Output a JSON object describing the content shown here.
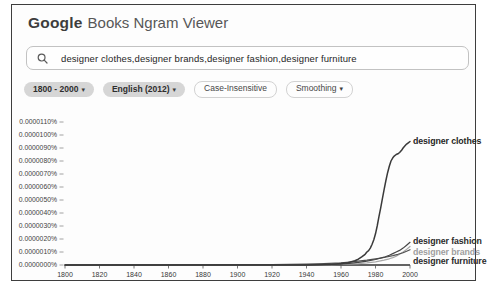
{
  "header": {
    "logo": "Google",
    "product": "Books Ngram Viewer"
  },
  "search": {
    "query": "designer clothes,designer brands,designer fashion,designer furniture"
  },
  "icons": {
    "search": "magnifier-icon",
    "dropdown_caret": "▾"
  },
  "filters": [
    {
      "label": "1800 - 2000",
      "dropdown": true,
      "filled": true
    },
    {
      "label": "English (2012)",
      "dropdown": true,
      "filled": true
    },
    {
      "label": "Case-Insensitive",
      "dropdown": false,
      "filled": false
    },
    {
      "label": "Smoothing",
      "dropdown": true,
      "filled": false
    }
  ],
  "chart_data": {
    "type": "line",
    "title": "",
    "xlabel": "",
    "ylabel": "",
    "x_range": [
      1800,
      2000
    ],
    "y_range_percent": [
      0,
      1.15e-05
    ],
    "y_unit": "percent, values below given in 1e-6 %",
    "grid": false,
    "legend_position": "end-of-line labels",
    "xticks": [
      1800,
      1820,
      1840,
      1860,
      1880,
      1900,
      1920,
      1940,
      1960,
      1980,
      2000
    ],
    "yticks": [
      "0.0000110%",
      "0.0000100%",
      "0.0000090%",
      "0.0000080%",
      "0.0000070%",
      "0.0000060%",
      "0.0000050%",
      "0.0000040%",
      "0.0000030%",
      "0.0000020%",
      "0.0000010%",
      "0.0000000%"
    ],
    "series": [
      {
        "name": "designer brands",
        "color": "#a8a8a8",
        "label_color": "#9f9f9f",
        "label_dy": 6,
        "points": [
          [
            1800,
            0
          ],
          [
            1900,
            0
          ],
          [
            1950,
            0.01
          ],
          [
            1960,
            0.04
          ],
          [
            1970,
            0.1
          ],
          [
            1975,
            0.16
          ],
          [
            1980,
            0.25
          ],
          [
            1985,
            0.38
          ],
          [
            1988,
            0.48
          ],
          [
            1990,
            0.57
          ],
          [
            1992,
            0.68
          ],
          [
            1994,
            0.82
          ],
          [
            1996,
            1.0
          ],
          [
            1998,
            1.2
          ],
          [
            2000,
            1.42
          ]
        ]
      },
      {
        "name": "designer furniture",
        "color": "#505050",
        "label_color": "#2b2b2b",
        "label_dy": 12,
        "points": [
          [
            1800,
            0
          ],
          [
            1860,
            0.01
          ],
          [
            1900,
            0.02
          ],
          [
            1920,
            0.03
          ],
          [
            1940,
            0.06
          ],
          [
            1950,
            0.1
          ],
          [
            1960,
            0.16
          ],
          [
            1965,
            0.22
          ],
          [
            1970,
            0.3
          ],
          [
            1975,
            0.38
          ],
          [
            1980,
            0.48
          ],
          [
            1985,
            0.58
          ],
          [
            1990,
            0.72
          ],
          [
            1993,
            0.82
          ],
          [
            1996,
            0.95
          ],
          [
            1998,
            1.05
          ],
          [
            2000,
            1.18
          ]
        ]
      },
      {
        "name": "designer fashion",
        "color": "#454545",
        "label_color": "#2b2b2b",
        "label_dy": -1,
        "points": [
          [
            1800,
            0
          ],
          [
            1900,
            0
          ],
          [
            1940,
            0.01
          ],
          [
            1950,
            0.03
          ],
          [
            1960,
            0.07
          ],
          [
            1965,
            0.12
          ],
          [
            1970,
            0.2
          ],
          [
            1975,
            0.3
          ],
          [
            1980,
            0.42
          ],
          [
            1985,
            0.6
          ],
          [
            1988,
            0.75
          ],
          [
            1990,
            0.88
          ],
          [
            1992,
            1.0
          ],
          [
            1994,
            1.12
          ],
          [
            1996,
            1.3
          ],
          [
            1998,
            1.52
          ],
          [
            2000,
            1.75
          ]
        ]
      },
      {
        "name": "designer clothes",
        "color": "#3a3a3a",
        "label_color": "#262626",
        "label_dy": 0,
        "points": [
          [
            1800,
            0
          ],
          [
            1840,
            0
          ],
          [
            1880,
            0
          ],
          [
            1900,
            0
          ],
          [
            1920,
            0
          ],
          [
            1940,
            0
          ],
          [
            1946,
            0.02
          ],
          [
            1950,
            0.03
          ],
          [
            1955,
            0.06
          ],
          [
            1960,
            0.12
          ],
          [
            1964,
            0.18
          ],
          [
            1968,
            0.32
          ],
          [
            1970,
            0.45
          ],
          [
            1972,
            0.62
          ],
          [
            1974,
            0.82
          ],
          [
            1975,
            1.0
          ],
          [
            1976,
            1.1
          ],
          [
            1977,
            1.3
          ],
          [
            1978,
            1.6
          ],
          [
            1979,
            1.95
          ],
          [
            1980,
            2.4
          ],
          [
            1981,
            3.0
          ],
          [
            1982,
            3.7
          ],
          [
            1983,
            4.4
          ],
          [
            1984,
            5.1
          ],
          [
            1985,
            5.8
          ],
          [
            1986,
            6.5
          ],
          [
            1987,
            7.1
          ],
          [
            1988,
            7.6
          ],
          [
            1989,
            8.0
          ],
          [
            1990,
            8.25
          ],
          [
            1991,
            8.4
          ],
          [
            1992,
            8.5
          ],
          [
            1993,
            8.55
          ],
          [
            1994,
            8.65
          ],
          [
            1995,
            8.8
          ],
          [
            1996,
            9.0
          ],
          [
            1997,
            9.15
          ],
          [
            1998,
            9.3
          ],
          [
            1999,
            9.4
          ],
          [
            2000,
            9.5
          ]
        ]
      }
    ]
  }
}
